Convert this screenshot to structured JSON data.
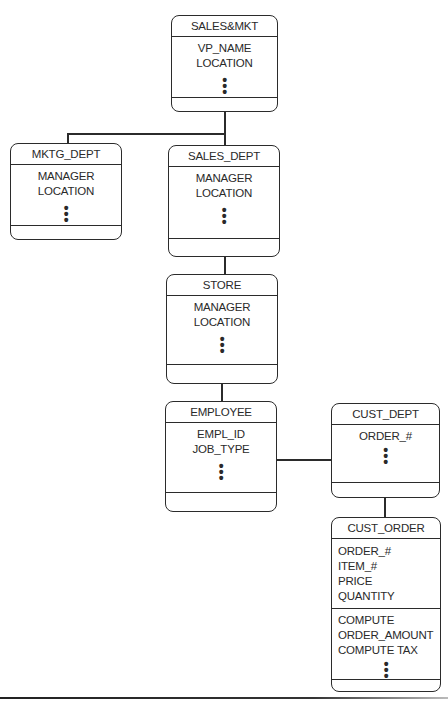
{
  "diagram": {
    "type": "class hierarchy",
    "classes": [
      {
        "id": "sales_mkt",
        "name": "SALES&MKT",
        "attributes": [
          "VP_NAME",
          "LOCATION"
        ],
        "ellipsis": "⋮"
      },
      {
        "id": "mktg_dept",
        "name": "MKTG_DEPT",
        "attributes": [
          "MANAGER",
          "LOCATION"
        ],
        "ellipsis": "⋮"
      },
      {
        "id": "sales_dept",
        "name": "SALES_DEPT",
        "attributes": [
          "MANAGER",
          "LOCATION"
        ],
        "ellipsis": "⋮"
      },
      {
        "id": "store",
        "name": "STORE",
        "attributes": [
          "MANAGER",
          "LOCATION"
        ],
        "ellipsis": "⋮"
      },
      {
        "id": "employee",
        "name": "EMPLOYEE",
        "attributes": [
          "EMPL_ID",
          "JOB_TYPE"
        ],
        "ellipsis": "⋮"
      },
      {
        "id": "cust_dept",
        "name": "CUST_DEPT",
        "attributes": [
          "ORDER_#"
        ],
        "ellipsis": "⋮"
      },
      {
        "id": "cust_order",
        "name": "CUST_ORDER",
        "attributes": [
          "ORDER_#",
          "ITEM_#",
          "PRICE",
          "QUANTITY"
        ],
        "methods": [
          "COMPUTE",
          "ORDER_AMOUNT",
          "COMPUTE TAX"
        ],
        "ellipsis": "⋮"
      }
    ],
    "connections": [
      [
        "SALES&MKT",
        "MKTG_DEPT"
      ],
      [
        "SALES&MKT",
        "SALES_DEPT"
      ],
      [
        "SALES_DEPT",
        "STORE"
      ],
      [
        "STORE",
        "EMPLOYEE"
      ],
      [
        "EMPLOYEE",
        "CUST_DEPT"
      ],
      [
        "CUST_DEPT",
        "CUST_ORDER"
      ]
    ]
  }
}
